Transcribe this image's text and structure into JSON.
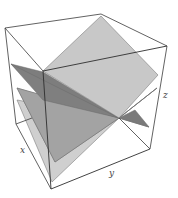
{
  "figure": {
    "type": "3d-plane-intersection",
    "axes": {
      "x_label": "x",
      "y_label": "y",
      "z_label": "z"
    },
    "colors": {
      "background": "#ffffff",
      "box_edge": "#3a3a3a",
      "plane_top": "#c9c9c9",
      "plane_dark": "#7d7d7d",
      "plane_middle": "#a0a0a0",
      "plane_bottom": "#d0d0d0"
    },
    "planes": [
      {
        "name": "upper-light-plane",
        "points": "101,16 158,75 119,118 43,71"
      },
      {
        "name": "lower-light-plane",
        "points": "17,100 119,118 52,182 17,125"
      },
      {
        "name": "middle-plane",
        "points": "17,88 119,118 157,88 55,162"
      },
      {
        "name": "dark-plane",
        "points": "11,64 119,118 149,127 43,95"
      }
    ]
  }
}
